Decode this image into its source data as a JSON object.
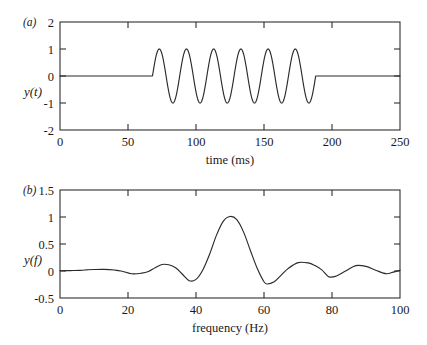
{
  "figure": {
    "background_color": "#ffffff",
    "line_color": "#2b2b2b",
    "axis_color": "#262626"
  },
  "panels": {
    "a": {
      "tag": "(a)",
      "ylabel": "y(t)",
      "xlabel": "time (ms)",
      "xticks": [
        "0",
        "50",
        "100",
        "150",
        "200",
        "250"
      ],
      "yticks": [
        "2",
        "1",
        "0",
        "-1",
        "-2"
      ]
    },
    "b": {
      "tag": "(b)",
      "ylabel": "y(f)",
      "xlabel": "frequency (Hz)",
      "xticks": [
        "0",
        "20",
        "40",
        "60",
        "80",
        "100"
      ],
      "yticks": [
        "1.5",
        "1",
        "0.5",
        "0",
        "-0.5"
      ]
    }
  },
  "chart_data": [
    {
      "type": "line",
      "panel": "a",
      "title": "",
      "xlabel": "time (ms)",
      "ylabel": "y(t)",
      "xlim": [
        0,
        250
      ],
      "ylim": [
        -2,
        2
      ],
      "xticks": [
        0,
        50,
        100,
        150,
        200,
        250
      ],
      "yticks": [
        -2,
        -1,
        0,
        1,
        2
      ],
      "grid": false,
      "legend": "none",
      "description": "Six-cycle 50 Hz sinusoidal tone burst of unit amplitude, zero outside the burst window",
      "signal": {
        "form": "tone-burst",
        "carrier_frequency_hz": 50,
        "amplitude": 1,
        "cycles": 6,
        "burst_start_ms": 68,
        "burst_end_ms": 188,
        "baseline_value": 0
      },
      "x": [
        0,
        10,
        20,
        30,
        40,
        50,
        60,
        68,
        73,
        78,
        83,
        88,
        93,
        98,
        103,
        108,
        113,
        118,
        123,
        128,
        133,
        138,
        143,
        148,
        153,
        158,
        163,
        168,
        173,
        178,
        183,
        188,
        200,
        210,
        220,
        230,
        240,
        250
      ],
      "values": [
        0,
        0,
        0,
        0,
        0,
        0,
        0,
        0,
        1,
        0,
        -1,
        0,
        1,
        0,
        -1,
        0,
        1,
        0,
        -1,
        0,
        1,
        0,
        -1,
        0,
        1,
        0,
        -1,
        0,
        1,
        0,
        -1,
        0,
        0,
        0,
        0,
        0,
        0,
        0
      ]
    },
    {
      "type": "line",
      "panel": "b",
      "title": "",
      "xlabel": "frequency (Hz)",
      "ylabel": "y(f)",
      "xlim": [
        0,
        100
      ],
      "ylim": [
        -0.5,
        1.5
      ],
      "xticks": [
        0,
        20,
        40,
        60,
        80,
        100
      ],
      "yticks": [
        -0.5,
        0,
        0.5,
        1,
        1.5
      ],
      "grid": false,
      "legend": "none",
      "description": "Magnitude-like spectrum of the tone burst: sinc-shaped main lobe centred at 50 Hz with peak 1.0, flanked by decaying side lobes",
      "spectrum": {
        "peak_frequency_hz": 50,
        "peak_value": 1.0,
        "main_lobe_span_hz": [
          40,
          61
        ],
        "first_negative_sidelobe_left": {
          "frequency_hz": 38,
          "value": -0.18
        },
        "first_negative_sidelobe_right": {
          "frequency_hz": 61,
          "value": -0.24
        },
        "sidelobe_peaks": [
          {
            "frequency_hz": 13,
            "value": 0.03
          },
          {
            "frequency_hz": 30,
            "value": 0.12
          },
          {
            "frequency_hz": 70,
            "value": 0.16
          },
          {
            "frequency_hz": 87,
            "value": 0.1
          }
        ],
        "sidelobe_minima": [
          {
            "frequency_hz": 21,
            "value": -0.05
          },
          {
            "frequency_hz": 79,
            "value": -0.11
          },
          {
            "frequency_hz": 96,
            "value": -0.05
          }
        ]
      },
      "x": [
        0,
        3,
        6,
        8,
        10,
        13,
        16,
        18,
        21,
        24,
        26,
        28,
        30,
        32,
        34,
        36,
        38,
        40,
        42,
        44,
        46,
        48,
        50,
        52,
        54,
        56,
        58,
        60,
        61,
        63,
        65,
        67,
        70,
        73,
        75,
        77,
        79,
        81,
        84,
        87,
        90,
        93,
        96,
        98,
        100
      ],
      "values": [
        0.005,
        0.008,
        0.012,
        0.022,
        0.028,
        0.03,
        0.018,
        0.0,
        -0.05,
        -0.04,
        -0.01,
        0.06,
        0.12,
        0.115,
        0.06,
        -0.06,
        -0.18,
        -0.155,
        0.02,
        0.31,
        0.66,
        0.92,
        1.01,
        0.95,
        0.72,
        0.38,
        0.05,
        -0.2,
        -0.24,
        -0.2,
        -0.08,
        0.04,
        0.155,
        0.15,
        0.1,
        0.02,
        -0.105,
        -0.1,
        0.0,
        0.1,
        0.085,
        0.01,
        -0.05,
        -0.02,
        0.015
      ]
    }
  ]
}
